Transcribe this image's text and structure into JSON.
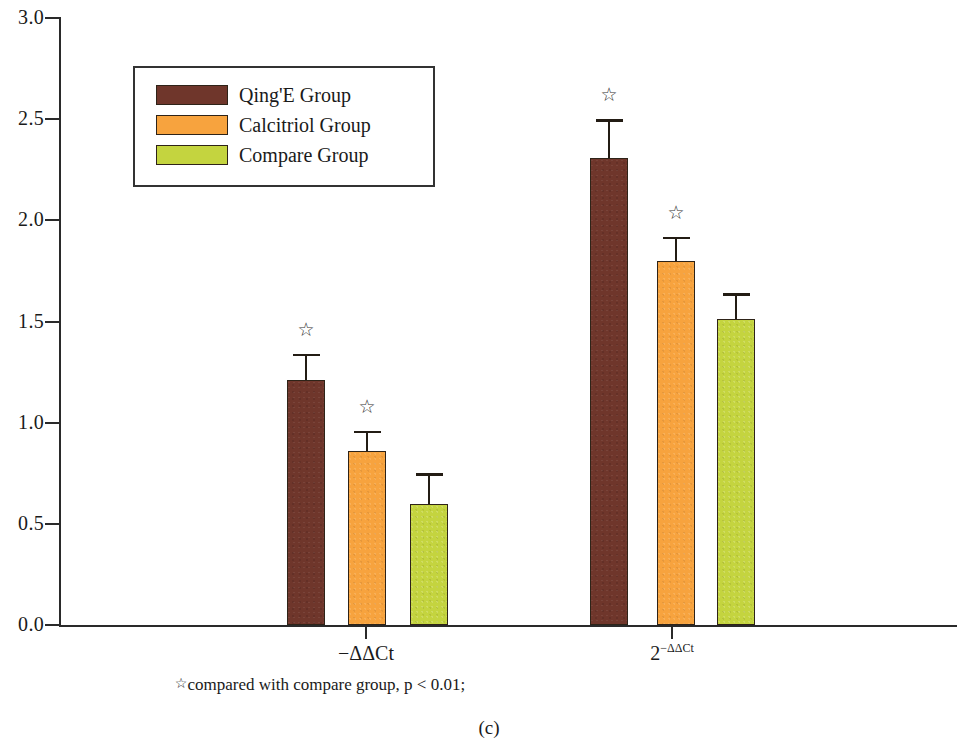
{
  "chart_data": {
    "type": "bar",
    "title": "",
    "subtitle": "",
    "panel_label": "(c)",
    "xlabel": "",
    "ylabel": "",
    "categories": [
      "−ΔΔCt",
      "2−ΔΔCt"
    ],
    "category_labels_display": [
      {
        "base": "−ΔΔCt",
        "sup": ""
      },
      {
        "base": "2",
        "sup": "−ΔΔCt"
      }
    ],
    "series": [
      {
        "name": "Qing'E Group",
        "color": "#6f362b",
        "values": [
          1.21,
          2.31
        ],
        "errors": [
          0.13,
          0.19
        ],
        "significance": [
          "☆",
          "☆"
        ]
      },
      {
        "name": "Calcitriol Group",
        "color": "#f7a33e",
        "values": [
          0.86,
          1.8
        ],
        "errors": [
          0.1,
          0.12
        ],
        "significance": [
          "☆",
          "☆"
        ]
      },
      {
        "name": "Compare Group",
        "color": "#c4d43f",
        "values": [
          0.6,
          1.51
        ],
        "errors": [
          0.15,
          0.13
        ],
        "significance": [
          "",
          ""
        ]
      }
    ],
    "ylim": [
      0.0,
      3.0
    ],
    "yticks": [
      "0.0",
      "0.5",
      "1.0",
      "1.5",
      "2.0",
      "2.5",
      "3.0"
    ],
    "ytick_values": [
      0.0,
      0.5,
      1.0,
      1.5,
      2.0,
      2.5,
      3.0
    ],
    "grid": false,
    "legend_position": "upper-left-inside",
    "annotations": [
      "☆compared with compare group, p < 0.01;"
    ]
  },
  "legend": {
    "items": [
      {
        "label": "Qing'E Group",
        "color": "#6f362b"
      },
      {
        "label": "Calcitriol Group",
        "color": "#f7a33e"
      },
      {
        "label": "Compare Group",
        "color": "#c4d43f"
      }
    ]
  },
  "yaxis": {
    "ticks": [
      {
        "label": "3.0"
      },
      {
        "label": "2.5"
      },
      {
        "label": "2.0"
      },
      {
        "label": "1.5"
      },
      {
        "label": "1.0"
      },
      {
        "label": "0.5"
      },
      {
        "label": "0.0"
      }
    ]
  },
  "xaxis": {
    "ticks": [
      {
        "base": "−ΔΔCt",
        "sup": ""
      },
      {
        "base": "2",
        "sup": "−ΔΔCt"
      }
    ]
  },
  "footnote": {
    "star": "☆",
    "text": "compared with compare group, p < 0.01;"
  },
  "panel": {
    "label": "(c)"
  },
  "bars": [
    {
      "series": "Qing'E Group",
      "group": "−ΔΔCt",
      "value": 1.21,
      "error": 0.13,
      "star": "☆"
    },
    {
      "series": "Calcitriol Group",
      "group": "−ΔΔCt",
      "value": 0.86,
      "error": 0.1,
      "star": "☆"
    },
    {
      "series": "Compare Group",
      "group": "−ΔΔCt",
      "value": 0.6,
      "error": 0.15,
      "star": ""
    },
    {
      "series": "Qing'E Group",
      "group": "2−ΔΔCt",
      "value": 2.31,
      "error": 0.19,
      "star": "☆"
    },
    {
      "series": "Calcitriol Group",
      "group": "2−ΔΔCt",
      "value": 1.8,
      "error": 0.12,
      "star": "☆"
    },
    {
      "series": "Compare Group",
      "group": "2−ΔΔCt",
      "value": 1.51,
      "error": 0.13,
      "star": ""
    }
  ]
}
